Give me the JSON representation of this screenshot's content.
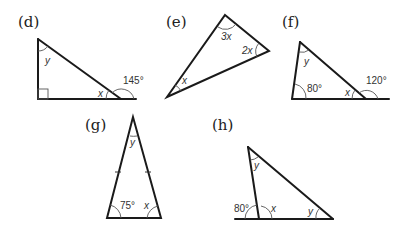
{
  "figures": [
    {
      "id": "d",
      "label": "(d)",
      "angles": {
        "top": "y",
        "base_interior": "x",
        "exterior": "145°",
        "bottom_left": "right-angle"
      }
    },
    {
      "id": "e",
      "label": "(e)",
      "angles": {
        "top": "3x",
        "right": "2x",
        "bottom_left": "x"
      }
    },
    {
      "id": "f",
      "label": "(f)",
      "angles": {
        "top": "y",
        "bottom_left": "80°",
        "base_interior": "x",
        "exterior": "120°"
      }
    },
    {
      "id": "g",
      "label": "(g)",
      "angles": {
        "apex": "y",
        "bottom_left": "75°",
        "bottom_right": "x"
      },
      "equal_sides": true
    },
    {
      "id": "h",
      "label": "(h)",
      "angles": {
        "top": "y",
        "exterior": "80°",
        "base_interior": "x",
        "right": "y"
      }
    }
  ]
}
